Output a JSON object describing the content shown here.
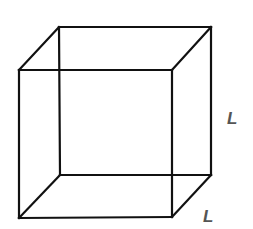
{
  "diagram": {
    "type": "wireframe-cube",
    "stroke_color": "#111111",
    "label_color": "#555555",
    "labels": {
      "height": "L",
      "depth": "L"
    },
    "vertices": {
      "front_top_left": [
        19,
        70
      ],
      "front_top_right": [
        172,
        70
      ],
      "front_bottom_left": [
        19,
        218
      ],
      "front_bottom_right": [
        172,
        217
      ],
      "back_top_left": [
        59,
        27
      ],
      "back_top_right": [
        211,
        27
      ],
      "back_bottom_left": [
        60,
        175
      ],
      "back_bottom_right": [
        211,
        175
      ]
    }
  }
}
